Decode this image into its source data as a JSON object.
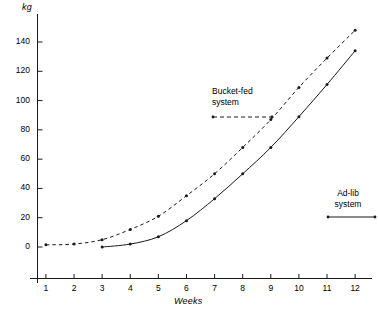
{
  "chart_data": {
    "type": "line",
    "title": "",
    "xlabel": "Weeks",
    "ylabel": "kg",
    "xlim": [
      0.4,
      12.4
    ],
    "ylim": [
      -18,
      155
    ],
    "grid": false,
    "legend_position": "inside-plot",
    "x_ticks": [
      "1",
      "2",
      "3",
      "4",
      "5",
      "6",
      "7",
      "8",
      "9",
      "10",
      "11",
      "12"
    ],
    "x_tick_values": [
      1,
      2,
      3,
      4,
      5,
      6,
      7,
      8,
      9,
      10,
      11,
      12
    ],
    "y_ticks": [
      "0",
      "20",
      "40",
      "60",
      "80",
      "100",
      "120",
      "140"
    ],
    "y_tick_values": [
      0,
      20,
      40,
      60,
      80,
      100,
      120,
      140
    ],
    "series": [
      {
        "name": "Bucket-fed system",
        "style": "dashed",
        "marker": "dot",
        "color": "#1a1a1a",
        "x": [
          1,
          2,
          3,
          4,
          5,
          6,
          7,
          8,
          9,
          10,
          11,
          12
        ],
        "values": [
          1.5,
          2,
          5,
          12,
          21,
          35,
          50,
          68,
          87,
          109,
          129,
          148
        ]
      },
      {
        "name": "Ad-lib system",
        "style": "solid",
        "marker": "dot",
        "color": "#1a1a1a",
        "x": [
          3,
          4,
          5,
          6,
          7,
          8,
          9,
          10,
          11,
          12
        ],
        "values": [
          0,
          2,
          7,
          18,
          33,
          50,
          68,
          89,
          111,
          134
        ]
      }
    ],
    "annotations": [
      {
        "name": "bucket-fed-legend",
        "label_line1": "Bucket-fed",
        "label_line2": "system",
        "sample_style": "dashed"
      },
      {
        "name": "ad-lib-legend",
        "label_line1": "Ad-lib",
        "label_line2": "system",
        "sample_style": "solid"
      }
    ]
  },
  "axes": {
    "y_title": "kg",
    "x_title": "Weeks"
  },
  "legend": {
    "bucket": {
      "line1": "Bucket-fed",
      "line2": "system"
    },
    "adlib": {
      "line1": "Ad-lib",
      "line2": "system"
    }
  },
  "colors": {
    "ink": "#1a1a1a",
    "background": "#ffffff"
  }
}
